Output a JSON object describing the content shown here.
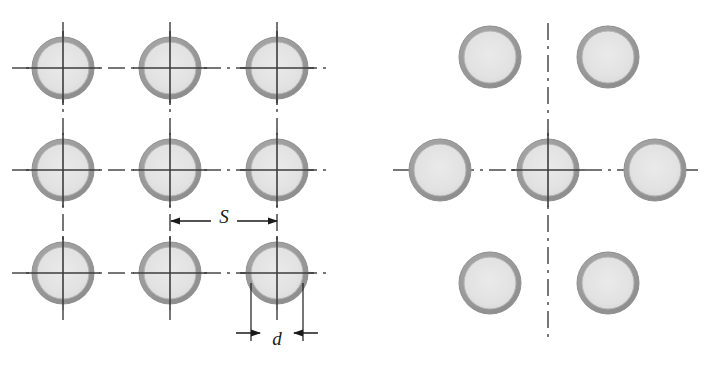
{
  "figure": {
    "background_color": "#ffffff"
  },
  "style": {
    "ring_outer_color": "#9a9a9a",
    "ring_inner_fill": "#e2e2e2",
    "ring_edge_color": "#8f8f8f",
    "centerline_color": "#4a4a4a",
    "dimension_line_color": "#1a1a1a",
    "label_color": "#1a1a1a",
    "ring_band_width": 5,
    "outer_radius": 31,
    "inner_radius": 26
  },
  "left_diagram": {
    "name": "square-inline-hole-pattern",
    "columns_x": [
      63,
      170,
      277
    ],
    "rows_y": [
      68,
      170,
      273
    ],
    "holes": [
      {
        "id": "hole-r1-c1",
        "cx": 63,
        "cy": 68
      },
      {
        "id": "hole-r1-c2",
        "cx": 170,
        "cy": 68
      },
      {
        "id": "hole-r1-c3",
        "cx": 277,
        "cy": 68
      },
      {
        "id": "hole-r2-c1",
        "cx": 63,
        "cy": 170
      },
      {
        "id": "hole-r2-c2",
        "cx": 170,
        "cy": 170
      },
      {
        "id": "hole-r2-c3",
        "cx": 277,
        "cy": 170
      },
      {
        "id": "hole-r3-c1",
        "cx": 63,
        "cy": 273
      },
      {
        "id": "hole-r3-c2",
        "cx": 170,
        "cy": 273
      },
      {
        "id": "hole-r3-c3",
        "cx": 277,
        "cy": 273
      }
    ],
    "horizontal_centerlines": [
      {
        "y": 68,
        "x1": 12,
        "x2": 330
      },
      {
        "y": 170,
        "x1": 12,
        "x2": 330
      },
      {
        "y": 273,
        "x1": 12,
        "x2": 330
      }
    ],
    "vertical_centerlines": [
      {
        "x": 63,
        "y1": 22,
        "y2": 320
      },
      {
        "x": 170,
        "y1": 22,
        "y2": 320
      },
      {
        "x": 277,
        "y1": 22,
        "y2": 320
      }
    ],
    "dimensions": [
      {
        "id": "pitch-dimension",
        "label": "S",
        "orientation": "horizontal",
        "y": 221,
        "from_x": 171,
        "to_x": 277,
        "arrow_direction": "outward",
        "label_x": 224,
        "label_y": 216
      },
      {
        "id": "diameter-dimension",
        "label": "d",
        "orientation": "horizontal",
        "y": 333,
        "from_x": 251,
        "to_x": 303,
        "arrow_direction": "inward",
        "label_x": 277,
        "label_y": 339,
        "extension_lines": [
          {
            "x": 251,
            "y1": 283,
            "y2": 341
          },
          {
            "x": 303,
            "y1": 283,
            "y2": 341
          }
        ]
      }
    ]
  },
  "right_diagram": {
    "name": "staggered-diagonal-hole-pattern",
    "center": {
      "cx": 548,
      "cy": 170
    },
    "holes": [
      {
        "id": "hole-top-left",
        "cx": 490,
        "cy": 57
      },
      {
        "id": "hole-top-right",
        "cx": 608,
        "cy": 57
      },
      {
        "id": "hole-mid-left",
        "cx": 440,
        "cy": 170
      },
      {
        "id": "hole-mid-center",
        "cx": 548,
        "cy": 170
      },
      {
        "id": "hole-mid-right",
        "cx": 655,
        "cy": 170
      },
      {
        "id": "hole-bottom-left",
        "cx": 490,
        "cy": 283
      },
      {
        "id": "hole-bottom-right",
        "cx": 608,
        "cy": 283
      }
    ],
    "horizontal_centerlines": [
      {
        "y": 170,
        "x1": 393,
        "x2": 700
      }
    ],
    "vertical_centerlines": [
      {
        "x": 548,
        "y1": 23,
        "y2": 342
      }
    ],
    "dimensions": []
  }
}
